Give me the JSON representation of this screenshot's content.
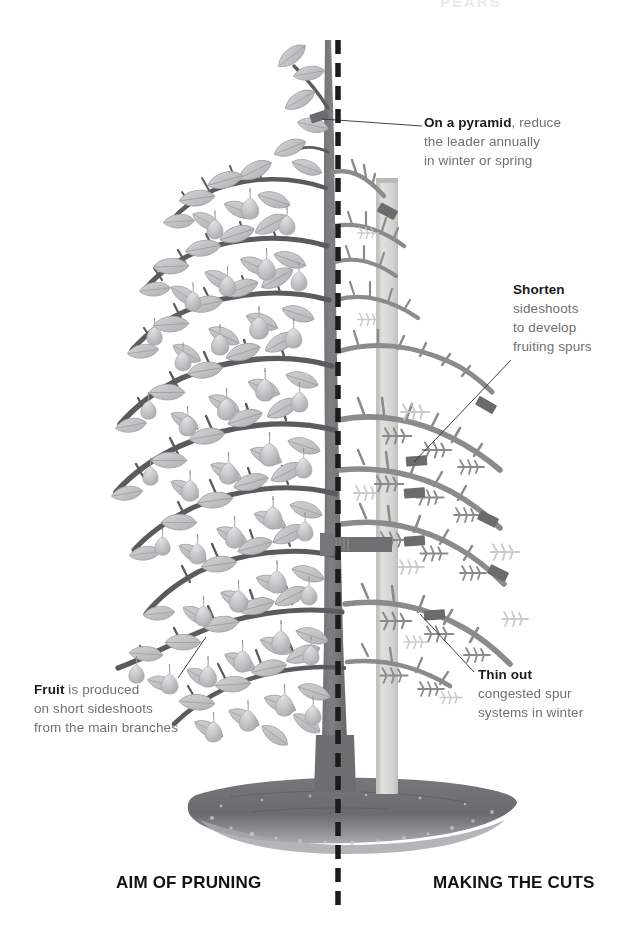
{
  "figure": {
    "palette": {
      "background": "#ffffff",
      "branch_dark": "#5a5b5d",
      "branch_mid": "#8a8b8d",
      "branch_light": "#b9babc",
      "leaf_fill": "#c6c7c9",
      "leaf_edge": "#a9aaac",
      "fruit_fill": "#c2c3c5",
      "fruit_highlight": "#dcdddf",
      "stake": "#d6d7d3",
      "soil": "#6e6f71",
      "soil_light": "#9a9b9d",
      "cut_mark": "#6a6b6d",
      "tie": "#6f7072",
      "center_line": "#1b1b1b",
      "leader_text": "#6f7072",
      "heading_text": "#111214"
    },
    "center_divider": {
      "name": "dashed-center-line",
      "style": "dashed",
      "orientation": "vertical",
      "x": 338,
      "top": 40,
      "bottom": 905
    }
  },
  "callouts": [
    {
      "id": "pyramid",
      "bold": "On a pyramid",
      "rest": ", reduce",
      "lines": [
        "the leader annually",
        "in winter or spring"
      ],
      "leader_from": [
        424,
        126
      ],
      "leader_to": [
        322,
        119
      ]
    },
    {
      "id": "shorten",
      "bold": "Shorten",
      "rest": "",
      "lines": [
        "sideshoots",
        "to develop",
        "fruiting spurs"
      ],
      "leader_from": [
        511,
        360
      ],
      "leader_to": [
        414,
        462
      ]
    },
    {
      "id": "thin",
      "bold": "Thin out",
      "rest": "",
      "lines": [
        "congested spur",
        "systems in winter"
      ],
      "leader_from": [
        476,
        672
      ],
      "leader_to": [
        420,
        614
      ]
    },
    {
      "id": "fruit",
      "bold": "Fruit",
      "rest": " is produced",
      "lines": [
        "on short sideshoots",
        "from the main branches"
      ],
      "leader_from": [
        176,
        678
      ],
      "leader_to": [
        206,
        637
      ]
    }
  ],
  "sections": {
    "left_title": "AIM OF PRUNING",
    "right_title": "MAKING THE CUTS"
  },
  "top_remnant": "PEARS",
  "cut_marks": [
    {
      "x": 318,
      "y": 119,
      "angle": -18
    },
    {
      "x": 387,
      "y": 212,
      "angle": 28
    },
    {
      "x": 485,
      "y": 406,
      "angle": 30
    },
    {
      "x": 417,
      "y": 461,
      "angle": -4
    },
    {
      "x": 415,
      "y": 493,
      "angle": -4
    },
    {
      "x": 487,
      "y": 519,
      "angle": 26
    },
    {
      "x": 414,
      "y": 541,
      "angle": -4
    },
    {
      "x": 497,
      "y": 573,
      "angle": 26
    },
    {
      "x": 434,
      "y": 615,
      "angle": -4
    }
  ],
  "tree_tie": {
    "x": 330,
    "y": 544,
    "width": 60,
    "height": 14
  }
}
